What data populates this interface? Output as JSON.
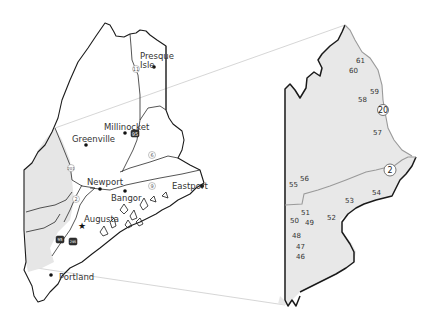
{
  "colors": {
    "shaded_region": "#e8e8e8",
    "border": "#1a1a1a",
    "route_line": "#9a9a9a",
    "leader_line": "#bfbfbf",
    "background": "#ffffff"
  },
  "overview_map": {
    "cities": [
      {
        "name": "Presque Isle",
        "line1": "Presque",
        "line2": "Isle",
        "marker": "dot"
      },
      {
        "name": "Millinocket",
        "marker": "dot"
      },
      {
        "name": "Greenville",
        "marker": "dot"
      },
      {
        "name": "Newport",
        "marker": "dot"
      },
      {
        "name": "Bangor",
        "marker": "dot"
      },
      {
        "name": "Eastport",
        "marker": "dot"
      },
      {
        "name": "Augusta",
        "marker": "star"
      },
      {
        "name": "Portland",
        "marker": "dot"
      }
    ],
    "route_shields": [
      {
        "label": "11",
        "type": "state"
      },
      {
        "label": "95",
        "type": "interstate"
      },
      {
        "label": "6",
        "type": "state"
      },
      {
        "label": "9",
        "type": "state"
      },
      {
        "label": "201",
        "type": "us"
      },
      {
        "label": "2",
        "type": "us"
      },
      {
        "label": "95",
        "type": "interstate"
      },
      {
        "label": "295",
        "type": "interstate"
      }
    ]
  },
  "detail_map": {
    "route_shields": [
      {
        "label": "20",
        "type": "us"
      },
      {
        "label": "2",
        "type": "us"
      }
    ],
    "exit_numbers": [
      "61",
      "60",
      "59",
      "58",
      "57",
      "56",
      "55",
      "54",
      "53",
      "52",
      "51",
      "50",
      "49",
      "48",
      "47",
      "46"
    ]
  }
}
